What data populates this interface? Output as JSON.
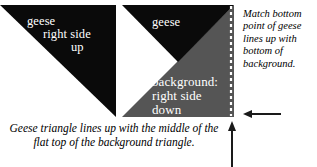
{
  "diagram": {
    "colors": {
      "geese_fill": "#0a0a0a",
      "background_fill": "#555555",
      "page_background": "#ffffff",
      "label_text": "#ffffff",
      "note_text": "#000000",
      "dashed_guide": "#ffffff",
      "arrow": "#1a1a1a"
    },
    "left_figure": {
      "name": "geese-triangle-right-side-up",
      "label_lines": [
        "geese",
        "right side",
        "up"
      ]
    },
    "middle_figure": {
      "name": "geese-over-background",
      "geese_label": "geese",
      "background_label_lines": [
        "background:",
        "right side",
        "down"
      ]
    },
    "notes": {
      "right": "Match bottom point of geese lines up with bottom of background.",
      "bottom_line1": "Geese triangle lines up with the middle of the",
      "bottom_line2": "flat top of the background triangle."
    },
    "markers": {
      "dashed_guide_label": "vertical-alignment-guide",
      "horizontal_arrow_label": "bottom-edge-pointer",
      "vertical_arrow_label": "right-edge-pointer"
    }
  }
}
